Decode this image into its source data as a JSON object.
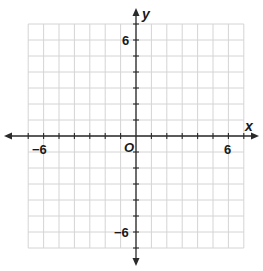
{
  "figure": {
    "type": "coordinate-plane",
    "x_axis": {
      "name": "x",
      "min": -7,
      "max": 7,
      "labeled_ticks": [
        {
          "value": -6,
          "label": "−6"
        },
        {
          "value": 6,
          "label": "6"
        }
      ]
    },
    "y_axis": {
      "name": "y",
      "min": -7,
      "max": 7,
      "labeled_ticks": [
        {
          "value": 6,
          "label": "6"
        },
        {
          "value": -6,
          "label": "−6"
        }
      ]
    },
    "origin_label": "O",
    "grid": {
      "on": true,
      "step": 1
    },
    "colors": {
      "grid": "#d4d4d4",
      "axis": "#2a2a2a",
      "text": "#1a1a1a"
    }
  }
}
